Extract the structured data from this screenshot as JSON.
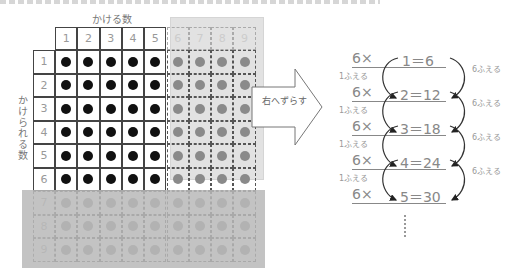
{
  "header_cut_text": "",
  "grid": {
    "column_axis_label": "かける数",
    "row_axis_label": "かけられる数",
    "column_headers": [
      "1",
      "2",
      "3",
      "4",
      "5",
      "6",
      "7",
      "8",
      "9"
    ],
    "row_headers": [
      "1",
      "2",
      "3",
      "4",
      "5",
      "6",
      "7",
      "8",
      "9"
    ],
    "black_dot_region": {
      "rows": 6,
      "cols": 5
    },
    "colors": {
      "black_dot": "#111111",
      "gray_dot": "#8a8a8a",
      "right_overlay": "#d9d9d9",
      "bottom_overlay": "#b9b9b9"
    }
  },
  "arrow": {
    "label": "右へずらす"
  },
  "equations": [
    {
      "left": "6×",
      "right": "1＝6"
    },
    {
      "left": "6×",
      "right": "2＝12"
    },
    {
      "left": "6×",
      "right": "3＝18"
    },
    {
      "left": "6×",
      "right": "4＝24"
    },
    {
      "left": "6×",
      "right": "5＝30"
    }
  ],
  "increments": {
    "left": [
      "1ふえる",
      "1ふえる",
      "1ふえる",
      "1ふえる"
    ],
    "right": [
      "6ふえる",
      "6ふえる",
      "6ふえる",
      "6ふえる"
    ]
  },
  "continuation": "⋮"
}
